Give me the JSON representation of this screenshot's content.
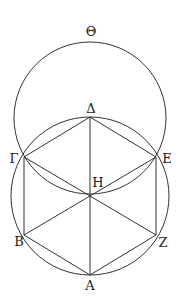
{
  "diagram": {
    "stroke_color": "#333333",
    "labels": {
      "theta": "Θ",
      "delta": "Δ",
      "gamma": "Γ",
      "epsilon": "Ε",
      "eta": "Η",
      "beta": "Β",
      "zeta": "Ζ",
      "alpha": "Α"
    }
  }
}
